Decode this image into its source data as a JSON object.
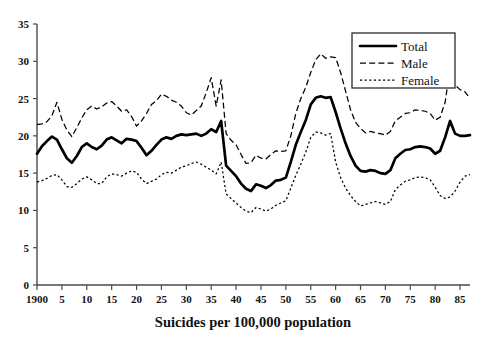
{
  "chart_data": {
    "type": "line",
    "title": "",
    "xlabel": "Suicides per 100,000 population",
    "ylabel": "",
    "xlim": [
      1900,
      1987
    ],
    "ylim": [
      0,
      35
    ],
    "grid": false,
    "legend_position": "top-right",
    "y_ticks": [
      0,
      5,
      10,
      15,
      20,
      25,
      30,
      35
    ],
    "y_tick_labels": [
      "0",
      "5",
      "10",
      "15",
      "20",
      "25",
      "30",
      "35"
    ],
    "x_ticks": [
      1900,
      1905,
      1910,
      1915,
      1920,
      1925,
      1930,
      1935,
      1940,
      1945,
      1950,
      1955,
      1960,
      1965,
      1970,
      1975,
      1980,
      1985
    ],
    "x_tick_labels": [
      "1900",
      "5",
      "10",
      "15",
      "20",
      "25",
      "30",
      "35",
      "40",
      "45",
      "50",
      "55",
      "60",
      "65",
      "70",
      "75",
      "80",
      "85"
    ],
    "x": [
      1900,
      1901,
      1902,
      1903,
      1904,
      1905,
      1906,
      1907,
      1908,
      1909,
      1910,
      1911,
      1912,
      1913,
      1914,
      1915,
      1916,
      1917,
      1918,
      1919,
      1920,
      1921,
      1922,
      1923,
      1924,
      1925,
      1926,
      1927,
      1928,
      1929,
      1930,
      1931,
      1932,
      1933,
      1934,
      1935,
      1936,
      1937,
      1938,
      1939,
      1940,
      1941,
      1942,
      1943,
      1944,
      1945,
      1946,
      1947,
      1948,
      1949,
      1950,
      1951,
      1952,
      1953,
      1954,
      1955,
      1956,
      1957,
      1958,
      1959,
      1960,
      1961,
      1962,
      1963,
      1964,
      1965,
      1966,
      1967,
      1968,
      1969,
      1970,
      1971,
      1972,
      1973,
      1974,
      1975,
      1976,
      1977,
      1978,
      1979,
      1980,
      1981,
      1982,
      1983,
      1984,
      1985,
      1986,
      1987
    ],
    "series": [
      {
        "name": "Total",
        "style": "solid-bold",
        "values": [
          17.6,
          18.6,
          19.3,
          19.9,
          19.5,
          18.2,
          17.0,
          16.4,
          17.3,
          18.5,
          19.0,
          18.5,
          18.2,
          18.7,
          19.5,
          19.8,
          19.4,
          19.0,
          19.6,
          19.5,
          19.3,
          18.4,
          17.4,
          18.0,
          18.8,
          19.5,
          19.8,
          19.6,
          20.0,
          20.2,
          20.1,
          20.2,
          20.3,
          20.0,
          20.3,
          20.9,
          20.5,
          22.0,
          16.0,
          15.3,
          14.6,
          13.6,
          12.9,
          12.6,
          13.5,
          13.3,
          13.0,
          13.4,
          14.0,
          14.1,
          14.4,
          16.5,
          18.8,
          20.5,
          22.1,
          24.2,
          25.1,
          25.3,
          25.1,
          25.2,
          23.2,
          21.0,
          19.0,
          17.3,
          16.0,
          15.3,
          15.2,
          15.4,
          15.3,
          15.0,
          14.9,
          15.4,
          17.0,
          17.6,
          18.1,
          18.2,
          18.5,
          18.6,
          18.5,
          18.3,
          17.6,
          18.0,
          19.8,
          22.0,
          20.3,
          20.0,
          20.0,
          20.1
        ]
      },
      {
        "name": "Male",
        "style": "dashed",
        "values": [
          21.5,
          21.6,
          21.9,
          22.7,
          24.5,
          22.2,
          20.8,
          19.9,
          21.1,
          22.4,
          23.5,
          24.0,
          23.6,
          23.9,
          24.4,
          24.6,
          24.0,
          23.3,
          23.5,
          22.6,
          21.3,
          22.0,
          23.0,
          24.2,
          24.7,
          25.6,
          25.3,
          24.8,
          24.5,
          24.0,
          23.1,
          22.8,
          23.4,
          24.0,
          25.8,
          27.8,
          24.0,
          27.5,
          20.3,
          19.4,
          18.8,
          17.5,
          16.3,
          16.4,
          17.4,
          17.0,
          16.9,
          17.5,
          18.0,
          17.9,
          18.0,
          20.0,
          23.0,
          25.0,
          26.5,
          28.5,
          30.2,
          31.0,
          30.4,
          30.6,
          30.5,
          28.5,
          26.0,
          23.5,
          21.8,
          21.0,
          20.4,
          20.6,
          20.4,
          20.3,
          20.1,
          20.6,
          22.0,
          22.5,
          23.0,
          23.1,
          23.5,
          23.4,
          23.3,
          23.0,
          22.1,
          22.5,
          24.5,
          29.0,
          26.8,
          26.2,
          25.9,
          25.0
        ]
      },
      {
        "name": "Female",
        "style": "dotted",
        "values": [
          13.8,
          14.0,
          14.3,
          14.7,
          14.8,
          14.1,
          13.2,
          13.1,
          13.6,
          14.2,
          14.5,
          14.1,
          13.6,
          13.6,
          14.5,
          14.9,
          14.8,
          14.6,
          15.0,
          15.3,
          15.1,
          14.2,
          13.6,
          13.9,
          14.2,
          14.8,
          15.1,
          15.0,
          15.4,
          15.8,
          16.0,
          16.3,
          16.5,
          16.2,
          15.8,
          15.4,
          14.9,
          16.5,
          12.2,
          11.6,
          11.0,
          10.4,
          9.9,
          9.7,
          10.4,
          10.2,
          9.9,
          10.2,
          10.7,
          11.0,
          11.3,
          13.0,
          14.7,
          16.2,
          17.8,
          19.8,
          20.5,
          20.4,
          20.1,
          20.3,
          16.5,
          14.4,
          13.0,
          12.0,
          11.2,
          10.6,
          10.8,
          11.0,
          11.2,
          11.0,
          10.8,
          11.2,
          12.8,
          13.4,
          13.9,
          14.1,
          14.4,
          14.5,
          14.4,
          14.1,
          13.1,
          12.0,
          11.6,
          11.8,
          12.6,
          13.8,
          14.6,
          14.8
        ]
      }
    ]
  },
  "legend": {
    "items": [
      {
        "label": "Total",
        "style": "solid-bold"
      },
      {
        "label": "Male",
        "style": "dashed"
      },
      {
        "label": "Female",
        "style": "dotted"
      }
    ]
  }
}
